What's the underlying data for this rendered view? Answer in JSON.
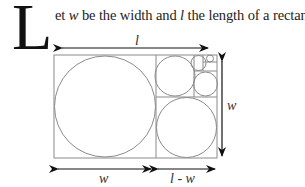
{
  "text": {
    "dropcap": "L",
    "intro_part1": "et ",
    "var_w": "w",
    "intro_part2": " be the width and ",
    "var_l": "l",
    "intro_part3": " the length of a rectangle."
  },
  "diagram": {
    "top_label": "l",
    "right_label": "w",
    "bottom_left_label": "w",
    "bottom_right_label": "l - w",
    "line_color": "#8a8a8a",
    "arrow_color": "#111111"
  }
}
